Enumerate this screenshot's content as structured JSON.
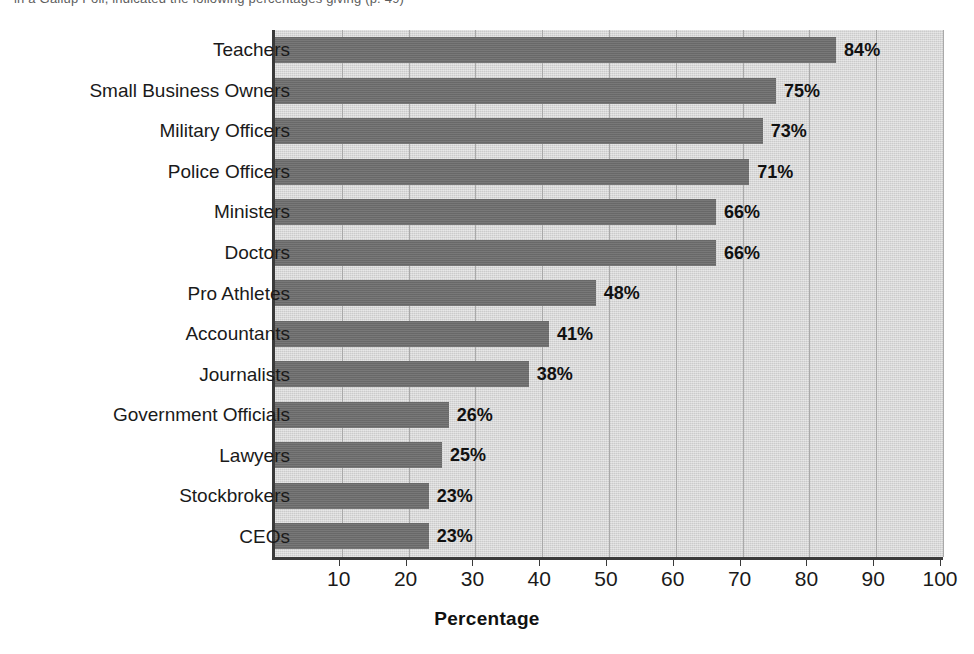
{
  "caption": {
    "text": "in a Gallup Poll, indicated the following percentages giving (p. 49)"
  },
  "chart_data": {
    "type": "bar",
    "orientation": "horizontal",
    "title": "",
    "xlabel": "Percentage",
    "ylabel": "",
    "xlim": [
      0,
      100
    ],
    "xticks": [
      10,
      20,
      30,
      40,
      50,
      60,
      70,
      80,
      90,
      100
    ],
    "xtick_labels": [
      "10",
      "20",
      "30",
      "40",
      "50",
      "60",
      "70",
      "80",
      "90",
      "100"
    ],
    "grid": true,
    "grid_axis": "x",
    "legend": "none",
    "value_label_suffix": "%",
    "categories": [
      "Teachers",
      "Small Business Owners",
      "Military Officers",
      "Police Officers",
      "Ministers",
      "Doctors",
      "Pro Athletes",
      "Accountants",
      "Journalists",
      "Government Officials",
      "Lawyers",
      "Stockbrokers",
      "CEOs"
    ],
    "values": [
      84,
      75,
      73,
      71,
      66,
      66,
      48,
      41,
      38,
      26,
      25,
      23,
      23
    ],
    "value_labels": [
      "84%",
      "75%",
      "73%",
      "71%",
      "66%",
      "66%",
      "48%",
      "41%",
      "38%",
      "26%",
      "25%",
      "23%",
      "23%"
    ],
    "colors": {
      "bar": "#6e6e6e",
      "plot_background": "#d4d4d4",
      "gridline": "#a9a9a9",
      "axis": "#3a3a3a",
      "text": "#1a1a1a",
      "page_background": "#ffffff"
    }
  }
}
